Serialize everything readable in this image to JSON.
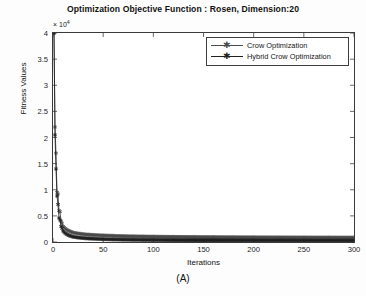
{
  "chart_data": {
    "type": "line",
    "title": "Optimization Objective Function : Rosen, Dimension:20",
    "caption": "(A)",
    "xlabel": "Iterations",
    "ylabel": "Fitness Values",
    "y_exponent_label": "× 10",
    "y_exponent_power": "4",
    "y_scale_factor": 10000,
    "xlim": [
      0,
      300
    ],
    "ylim": [
      0,
      40000
    ],
    "xticks": [
      0,
      50,
      100,
      150,
      200,
      250,
      300
    ],
    "xtick_labels": [
      "0",
      "50",
      "100",
      "150",
      "200",
      "250",
      "300"
    ],
    "yticks": [
      0,
      5000,
      10000,
      15000,
      20000,
      25000,
      30000,
      35000,
      40000
    ],
    "ytick_labels": [
      "0",
      "0.5",
      "1",
      "1.5",
      "2",
      "2.5",
      "3",
      "3.5",
      "4"
    ],
    "grid": false,
    "legend_position": "upper right",
    "marker": "star",
    "series": [
      {
        "name": "Crow Optimization",
        "color": "#4a4a4a",
        "marker": "star",
        "x": [
          1,
          2,
          3,
          4,
          5,
          6,
          7,
          8,
          9,
          10,
          12,
          14,
          16,
          18,
          20,
          24,
          28,
          32,
          36,
          40,
          50,
          60,
          70,
          80,
          90,
          100,
          120,
          140,
          160,
          180,
          200,
          225,
          250,
          275,
          300
        ],
        "y": [
          40000,
          22000,
          17000,
          9500,
          9200,
          6000,
          5800,
          4000,
          3600,
          3000,
          2600,
          2300,
          2100,
          1950,
          1800,
          1650,
          1550,
          1450,
          1400,
          1350,
          1250,
          1180,
          1120,
          1080,
          1050,
          1020,
          980,
          950,
          930,
          910,
          895,
          880,
          870,
          860,
          850
        ]
      },
      {
        "name": "Hybrid Crow Optimization",
        "color": "#202020",
        "marker": "star",
        "x": [
          1,
          2,
          3,
          4,
          5,
          6,
          7,
          8,
          9,
          10,
          12,
          14,
          16,
          18,
          20,
          24,
          28,
          32,
          36,
          40,
          50,
          60,
          70,
          80,
          90,
          100,
          120,
          140,
          160,
          180,
          200,
          225,
          250,
          275,
          300
        ],
        "y": [
          40000,
          20500,
          14000,
          8800,
          7200,
          4600,
          4200,
          3000,
          2600,
          2100,
          1700,
          1450,
          1250,
          1120,
          1000,
          880,
          790,
          720,
          670,
          630,
          540,
          490,
          450,
          420,
          400,
          385,
          360,
          345,
          335,
          325,
          318,
          310,
          305,
          300,
          295
        ]
      }
    ]
  },
  "legend": {
    "items": [
      {
        "label": "Crow Optimization",
        "color": "#4a4a4a"
      },
      {
        "label": "Hybrid Crow Optimization",
        "color": "#202020"
      }
    ]
  },
  "axes": {
    "frame_color": "#3a3a3a",
    "background": "#ffffff"
  }
}
